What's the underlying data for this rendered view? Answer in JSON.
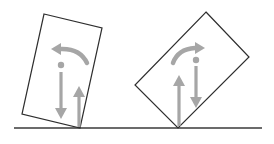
{
  "diagram": {
    "colors": {
      "outline": "#2e2e2e",
      "ground": "#3a3a3a",
      "arrows": "#a6a6a6",
      "background": "#ffffff"
    },
    "ground": {
      "x1": 14,
      "y1": 128,
      "x2": 262,
      "y2": 128
    },
    "blocks": [
      {
        "name": "left-block",
        "corners": [
          [
            44,
            14
          ],
          [
            102,
            28
          ],
          [
            80,
            128
          ],
          [
            22,
            114
          ]
        ],
        "center_of_gravity": [
          61,
          65
        ],
        "weight_arrow": {
          "x": 61,
          "y_start": 72,
          "y_tip": 119,
          "direction": "down"
        },
        "normal_arrow": {
          "x": 79,
          "y_start": 127,
          "y_tip": 87,
          "direction": "up"
        },
        "torque_arrow": {
          "direction": "counterclockwise",
          "path": "M 87 63 Q 80 48 60 49",
          "head_tip": [
            52,
            49
          ]
        }
      },
      {
        "name": "right-block",
        "corners": [
          [
            206,
            12
          ],
          [
            249,
            57
          ],
          [
            178,
            128
          ],
          [
            135,
            85
          ]
        ],
        "center_of_gravity": [
          196,
          60
        ],
        "weight_arrow": {
          "x": 196,
          "y_start": 66,
          "y_tip": 108,
          "direction": "down"
        },
        "normal_arrow": {
          "x": 179,
          "y_start": 125,
          "y_tip": 76,
          "direction": "up"
        },
        "torque_arrow": {
          "direction": "clockwise",
          "path": "M 173 63 Q 178 49 196 48",
          "head_tip": [
            204,
            48
          ]
        }
      }
    ]
  }
}
